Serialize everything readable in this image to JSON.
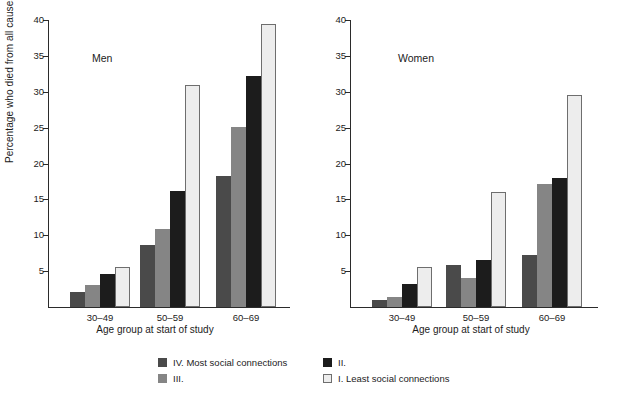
{
  "chart_data": {
    "type": "bar",
    "title": "",
    "xlabel": "Age group at start of study",
    "ylabel": "Percentage who died from all causes",
    "categories": [
      "30–49",
      "50–59",
      "60–69"
    ],
    "ylim": [
      0,
      40
    ],
    "yticks": [
      5,
      10,
      15,
      20,
      25,
      30,
      35,
      40
    ],
    "ytick_labels": [
      "5",
      "10",
      "15",
      "20",
      "25",
      "30",
      "35",
      "40"
    ],
    "grid": false,
    "legend_position": "bottom",
    "panels": [
      {
        "name": "Men",
        "series": [
          {
            "name": "IV. Most social connections",
            "color": "#4a4a4a",
            "values": [
              2.1,
              8.7,
              18.3
            ]
          },
          {
            "name": "III.",
            "color": "#858585",
            "values": [
              3.1,
              10.9,
              25.1
            ]
          },
          {
            "name": "II.",
            "color": "#1c1c1c",
            "values": [
              4.6,
              16.1,
              32.2
            ]
          },
          {
            "name": "I. Least social connections",
            "color": "#ededed",
            "values": [
              5.6,
              31.0,
              39.4
            ]
          }
        ]
      },
      {
        "name": "Women",
        "series": [
          {
            "name": "IV. Most social connections",
            "color": "#4a4a4a",
            "values": [
              1.0,
              5.9,
              7.3
            ]
          },
          {
            "name": "III.",
            "color": "#858585",
            "values": [
              1.4,
              4.0,
              17.1
            ]
          },
          {
            "name": "II.",
            "color": "#1c1c1c",
            "values": [
              3.2,
              6.6,
              18.0
            ]
          },
          {
            "name": "I. Least social connections",
            "color": "#ededed",
            "values": [
              5.6,
              16.0,
              29.6
            ]
          }
        ]
      }
    ],
    "legend": [
      {
        "label": "IV. Most social connections",
        "color": "#4a4a4a"
      },
      {
        "label": "II.",
        "color": "#1c1c1c"
      },
      {
        "label": "III.",
        "color": "#858585"
      },
      {
        "label": "I. Least social connections",
        "color": "#ededed"
      }
    ]
  },
  "axis": {
    "ylabel": "Percentage who died from all causes",
    "xlabel_left": "Age group at start of study",
    "xlabel_right": "Age group at start of study",
    "ytick_labels": [
      "5",
      "10",
      "15",
      "20",
      "25",
      "30",
      "35",
      "40"
    ],
    "xtick_labels": [
      "30–49",
      "50–59",
      "60–69"
    ]
  },
  "panel_titles": {
    "left": "Men",
    "right": "Women"
  },
  "legend": {
    "item1": "IV. Most social connections",
    "item2": "III.",
    "item3": "II.",
    "item4": "I. Least social connections"
  }
}
